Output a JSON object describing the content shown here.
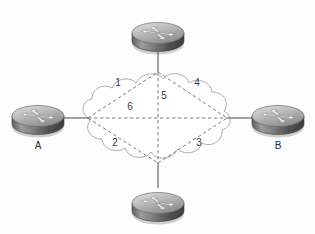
{
  "diagram": {
    "type": "network-topology",
    "title": "",
    "cloud": {
      "name": "network-cloud",
      "fill": "#ffffff",
      "stroke": "#9a9a9a"
    },
    "colors": {
      "link_stroke": "#7d7d7d",
      "edge_line": "#5a5a5a",
      "router_top_light": "#d8d8d8",
      "router_top_dark": "#8e8e8e",
      "router_body_light": "#9c9c9c",
      "router_body_dark": "#4a4a4a",
      "label_text": "#2b2b2b",
      "number_text": "#3a3a3a"
    },
    "routers": [
      {
        "id": "router-top",
        "label": "",
        "x": 158,
        "y": 30,
        "position": "top"
      },
      {
        "id": "router-left",
        "label": "A",
        "x": 40,
        "y": 118,
        "position": "left"
      },
      {
        "id": "router-right",
        "label": "B",
        "x": 276,
        "y": 118,
        "position": "right"
      },
      {
        "id": "router-bottom",
        "label": "",
        "x": 158,
        "y": 207,
        "position": "bottom"
      }
    ],
    "anchors": [
      {
        "id": "anchor-top",
        "x": 158,
        "y": 72
      },
      {
        "id": "anchor-left",
        "x": 88,
        "y": 118
      },
      {
        "id": "anchor-right",
        "x": 227,
        "y": 118
      },
      {
        "id": "anchor-bottom",
        "x": 158,
        "y": 163
      }
    ],
    "links": [
      {
        "id": "link-1",
        "label": "1",
        "from": "anchor-left",
        "to": "anchor-top",
        "label_x": 118,
        "label_y": 86
      },
      {
        "id": "link-2",
        "label": "2",
        "from": "anchor-left",
        "to": "anchor-bottom",
        "label_x": 115,
        "label_y": 146
      },
      {
        "id": "link-3",
        "label": "3",
        "from": "anchor-bottom",
        "to": "anchor-right",
        "label_x": 199,
        "label_y": 146
      },
      {
        "id": "link-4",
        "label": "4",
        "from": "anchor-top",
        "to": "anchor-right",
        "label_x": 197,
        "label_y": 86
      },
      {
        "id": "link-5",
        "label": "5",
        "from": "anchor-top",
        "to": "anchor-bottom",
        "label_x": 164,
        "label_y": 99
      },
      {
        "id": "link-6",
        "label": "6",
        "from": "anchor-left",
        "to": "anchor-right",
        "label_x": 130,
        "label_y": 110
      }
    ],
    "edge_lines": [
      {
        "id": "edge-top",
        "from": "router-top",
        "to": "anchor-top"
      },
      {
        "id": "edge-left",
        "from": "router-left",
        "to": "anchor-left"
      },
      {
        "id": "edge-right",
        "from": "router-right",
        "to": "anchor-right"
      },
      {
        "id": "edge-bottom",
        "from": "router-bottom",
        "to": "anchor-bottom"
      }
    ]
  }
}
